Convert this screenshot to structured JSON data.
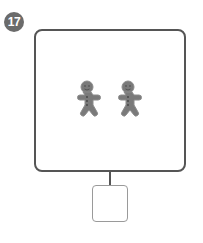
{
  "question": {
    "number": "17",
    "items": [
      {
        "type": "gingerbread-man",
        "color": "#7a7a7a"
      },
      {
        "type": "gingerbread-man",
        "color": "#7a7a7a"
      }
    ],
    "item_count_shown": 2,
    "answer_box": {
      "value": ""
    }
  },
  "colors": {
    "badge": "#6b6b6b",
    "frame_border": "#555555",
    "answer_border": "#9a9a9a",
    "cookie": "#7a7a7a"
  }
}
